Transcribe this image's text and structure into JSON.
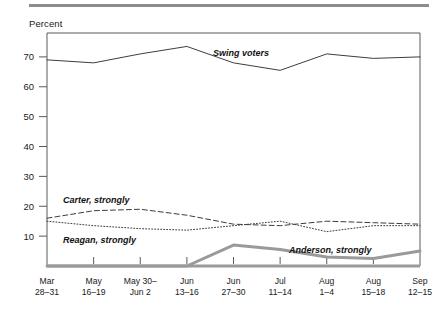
{
  "figure": {
    "axis_title": "Percent",
    "rule_color": "#8d8d8d"
  },
  "chart_data": {
    "type": "line",
    "title": "",
    "subtitle": "",
    "xlabel": "",
    "ylabel": "Percent",
    "ylim": [
      0,
      78
    ],
    "yticks": [
      10,
      20,
      30,
      40,
      50,
      60,
      70
    ],
    "ytick_labels": [
      "10",
      "20",
      "30",
      "40",
      "50",
      "60",
      "70"
    ],
    "grid": false,
    "legend_position": "inline-annotations",
    "categories": [
      "Mar 28–31",
      "May 16–19",
      "May 30–Jun 2",
      "Jun 13–16",
      "Jun 27–30",
      "Jul 11–14",
      "Aug 1–4",
      "Aug 15–18",
      "Sep 12–15"
    ],
    "category_lines": [
      [
        "Mar",
        "28–31"
      ],
      [
        "May",
        "16–19"
      ],
      [
        "May 30–",
        "Jun 2"
      ],
      [
        "Jun",
        "13–16"
      ],
      [
        "Jun",
        "27–30"
      ],
      [
        "Jul",
        "11–14"
      ],
      [
        "Aug",
        "1–4"
      ],
      [
        "Aug",
        "15–18"
      ],
      [
        "Sep",
        "12–15"
      ]
    ],
    "series": [
      {
        "name": "Swing voters",
        "style": "solid",
        "color": "#3d3d3d",
        "width": 1,
        "values": [
          69,
          68,
          71,
          73.5,
          68,
          65.5,
          71,
          69.5,
          70
        ]
      },
      {
        "name": "Carter, strongly",
        "style": "dashed",
        "color": "#3d3d3d",
        "width": 1,
        "values": [
          16,
          18.5,
          19,
          17,
          14,
          13.5,
          15,
          14.5,
          14
        ]
      },
      {
        "name": "Reagan, strongly",
        "style": "dotted",
        "color": "#3d3d3d",
        "width": 1,
        "values": [
          15,
          13.5,
          12.5,
          12,
          13.5,
          15,
          11.5,
          13.5,
          13.5
        ]
      },
      {
        "name": "Anderson, strongly",
        "style": "solid-thick",
        "color": "#9a9a9a",
        "width": 3,
        "values": [
          0,
          0,
          0,
          0,
          7,
          5.5,
          3,
          2.5,
          5
        ]
      }
    ],
    "annotations": [
      {
        "text": "Swing voters",
        "series": "Swing voters",
        "x": 213,
        "y": 56
      },
      {
        "text": "Carter, strongly",
        "series": "Carter, strongly",
        "x": 63,
        "y": 203
      },
      {
        "text": "Reagan, strongly",
        "series": "Reagan, strongly",
        "x": 63,
        "y": 243
      },
      {
        "text": "Anderson, strongly",
        "series": "Anderson, strongly",
        "x": 289,
        "y": 253
      }
    ]
  }
}
